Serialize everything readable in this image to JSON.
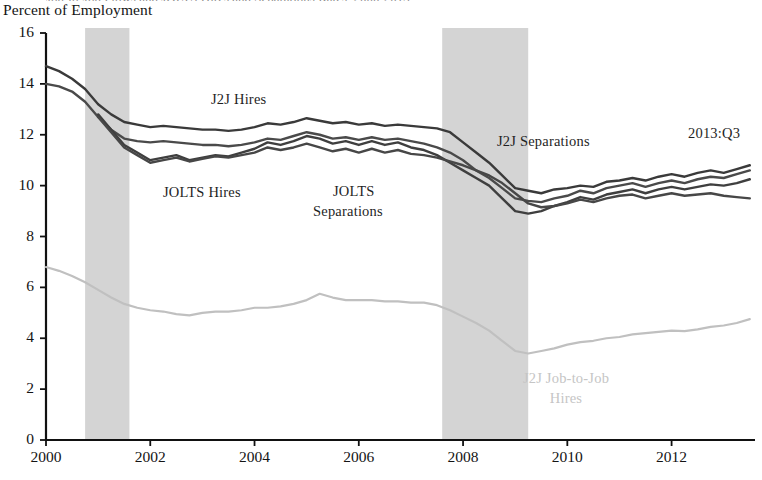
{
  "figure": {
    "cut_off_title_top": "Job-to-Job Flows and JOLTS Hires and Separations Rates, 2000-2013",
    "y_axis_title": "Percent of Employment",
    "date_stamp": "2013:Q3"
  },
  "annotations": [
    {
      "name": "j2j-hires-label",
      "text": "J2J Hires",
      "x": 211,
      "y": 91,
      "color": "#1f1f1f",
      "align": "left"
    },
    {
      "name": "jolts-hires-label",
      "text": "JOLTS Hires",
      "x": 163,
      "y": 184,
      "color": "#1f1f1f",
      "align": "left"
    },
    {
      "name": "jolts-separations-label-line1",
      "text": "JOLTS",
      "x": 333,
      "y": 183,
      "color": "#1f1f1f",
      "align": "left"
    },
    {
      "name": "jolts-separations-label-line2",
      "text": "Separations",
      "x": 313,
      "y": 203,
      "color": "#1f1f1f",
      "align": "left"
    },
    {
      "name": "j2j-separations-label",
      "text": "J2J Separations",
      "x": 497,
      "y": 133,
      "color": "#1f1f1f",
      "align": "left"
    },
    {
      "name": "date-stamp-label",
      "text": "2013:Q3",
      "x": 688,
      "y": 125,
      "color": "#1f1f1f",
      "align": "left"
    },
    {
      "name": "j2j-job-to-job-hires-label-line1",
      "text": "J2J Job-to-Job",
      "x": 566,
      "y": 370,
      "color": "#c5c5c5",
      "align": "center"
    },
    {
      "name": "j2j-job-to-job-hires-label-line2",
      "text": "Hires",
      "x": 566,
      "y": 390,
      "color": "#c5c5c5",
      "align": "center"
    }
  ],
  "chart_data": {
    "type": "line",
    "title": "Job-to-Job Flows and JOLTS Hires and Separations Rates",
    "subtitle": "",
    "xlabel": "",
    "ylabel": "Percent of Employment",
    "xlim": [
      2000.0,
      2013.6
    ],
    "ylim": [
      0,
      16
    ],
    "ytick_values": [
      0,
      2,
      4,
      6,
      8,
      10,
      12,
      14,
      16
    ],
    "ytick_labels": [
      "0",
      "2",
      "4",
      "6",
      "8",
      "10",
      "12",
      "14",
      "16"
    ],
    "xtick_values": [
      2000,
      2002,
      2004,
      2006,
      2008,
      2010,
      2012
    ],
    "xtick_labels": [
      "2000",
      "2002",
      "2004",
      "2006",
      "2008",
      "2010",
      "2012"
    ],
    "grid": false,
    "legend": "inline-annotations",
    "shaded_regions": [
      {
        "name": "recession-2001",
        "x0": 2000.75,
        "x1": 2001.6,
        "color": "#d4d4d4",
        "label": "recession"
      },
      {
        "name": "recession-2008",
        "x0": 2007.6,
        "x1": 2009.25,
        "color": "#d4d4d4",
        "label": "recession"
      }
    ],
    "series": [
      {
        "name": "J2J Hires",
        "color": "#3a3a3a",
        "width": 2.4,
        "x": [
          2000.0,
          2000.25,
          2000.5,
          2000.75,
          2001.0,
          2001.25,
          2001.5,
          2001.75,
          2002.0,
          2002.25,
          2002.5,
          2002.75,
          2003.0,
          2003.25,
          2003.5,
          2003.75,
          2004.0,
          2004.25,
          2004.5,
          2004.75,
          2005.0,
          2005.25,
          2005.5,
          2005.75,
          2006.0,
          2006.25,
          2006.5,
          2006.75,
          2007.0,
          2007.25,
          2007.5,
          2007.75,
          2008.0,
          2008.25,
          2008.5,
          2008.75,
          2009.0,
          2009.25,
          2009.5,
          2009.75,
          2010.0,
          2010.25,
          2010.5,
          2010.75,
          2011.0,
          2011.25,
          2011.5,
          2011.75,
          2012.0,
          2012.25,
          2012.5,
          2012.75,
          2013.0,
          2013.25,
          2013.5
        ],
        "values": [
          14.7,
          14.5,
          14.2,
          13.8,
          13.2,
          12.8,
          12.5,
          12.4,
          12.3,
          12.35,
          12.3,
          12.25,
          12.2,
          12.2,
          12.15,
          12.2,
          12.3,
          12.45,
          12.4,
          12.5,
          12.65,
          12.55,
          12.45,
          12.5,
          12.4,
          12.45,
          12.35,
          12.4,
          12.35,
          12.3,
          12.25,
          12.1,
          11.7,
          11.3,
          10.9,
          10.4,
          9.9,
          9.8,
          9.7,
          9.85,
          9.9,
          10.0,
          9.95,
          10.15,
          10.2,
          10.3,
          10.2,
          10.35,
          10.45,
          10.35,
          10.5,
          10.6,
          10.5,
          10.65,
          10.8
        ]
      },
      {
        "name": "J2J Separations",
        "color": "#4a4a4a",
        "width": 2.4,
        "x": [
          2000.0,
          2000.25,
          2000.5,
          2000.75,
          2001.0,
          2001.25,
          2001.5,
          2001.75,
          2002.0,
          2002.25,
          2002.5,
          2002.75,
          2003.0,
          2003.25,
          2003.5,
          2003.75,
          2004.0,
          2004.25,
          2004.5,
          2004.75,
          2005.0,
          2005.25,
          2005.5,
          2005.75,
          2006.0,
          2006.25,
          2006.5,
          2006.75,
          2007.0,
          2007.25,
          2007.5,
          2007.75,
          2008.0,
          2008.25,
          2008.5,
          2008.75,
          2009.0,
          2009.25,
          2009.5,
          2009.75,
          2010.0,
          2010.25,
          2010.5,
          2010.75,
          2011.0,
          2011.25,
          2011.5,
          2011.75,
          2012.0,
          2012.25,
          2012.5,
          2012.75,
          2013.0,
          2013.25,
          2013.5
        ],
        "values": [
          14.0,
          13.9,
          13.7,
          13.3,
          12.7,
          12.2,
          11.85,
          11.75,
          11.7,
          11.75,
          11.7,
          11.65,
          11.6,
          11.6,
          11.55,
          11.6,
          11.7,
          11.85,
          11.8,
          11.95,
          12.1,
          12.0,
          11.85,
          11.9,
          11.8,
          11.9,
          11.8,
          11.85,
          11.75,
          11.65,
          11.5,
          11.3,
          11.0,
          10.6,
          10.3,
          9.9,
          9.5,
          9.4,
          9.35,
          9.5,
          9.6,
          9.8,
          9.7,
          9.9,
          10.0,
          10.1,
          9.95,
          10.1,
          10.2,
          10.1,
          10.25,
          10.35,
          10.3,
          10.45,
          10.6
        ]
      },
      {
        "name": "JOLTS Hires",
        "color": "#3f3f3f",
        "width": 2.4,
        "x": [
          2001.0,
          2001.25,
          2001.5,
          2001.75,
          2002.0,
          2002.25,
          2002.5,
          2002.75,
          2003.0,
          2003.25,
          2003.5,
          2003.75,
          2004.0,
          2004.25,
          2004.5,
          2004.75,
          2005.0,
          2005.25,
          2005.5,
          2005.75,
          2006.0,
          2006.25,
          2006.5,
          2006.75,
          2007.0,
          2007.25,
          2007.5,
          2007.75,
          2008.0,
          2008.25,
          2008.5,
          2008.75,
          2009.0,
          2009.25,
          2009.5,
          2009.75,
          2010.0,
          2010.25,
          2010.5,
          2010.75,
          2011.0,
          2011.25,
          2011.5,
          2011.75,
          2012.0,
          2012.25,
          2012.5,
          2012.75,
          2013.0,
          2013.25,
          2013.5
        ],
        "values": [
          12.8,
          12.2,
          11.6,
          11.3,
          11.0,
          11.1,
          11.2,
          11.0,
          11.1,
          11.2,
          11.15,
          11.3,
          11.45,
          11.7,
          11.6,
          11.75,
          11.95,
          11.85,
          11.65,
          11.75,
          11.6,
          11.75,
          11.6,
          11.7,
          11.5,
          11.4,
          11.2,
          10.9,
          10.6,
          10.3,
          10.0,
          9.5,
          9.0,
          8.9,
          9.0,
          9.2,
          9.35,
          9.55,
          9.45,
          9.65,
          9.75,
          9.85,
          9.7,
          9.85,
          9.95,
          9.85,
          9.95,
          10.05,
          10.0,
          10.1,
          10.25
        ]
      },
      {
        "name": "JOLTS Separations",
        "color": "#474747",
        "width": 2.4,
        "x": [
          2001.0,
          2001.25,
          2001.5,
          2001.75,
          2002.0,
          2002.25,
          2002.5,
          2002.75,
          2003.0,
          2003.25,
          2003.5,
          2003.75,
          2004.0,
          2004.25,
          2004.5,
          2004.75,
          2005.0,
          2005.25,
          2005.5,
          2005.75,
          2006.0,
          2006.25,
          2006.5,
          2006.75,
          2007.0,
          2007.25,
          2007.5,
          2007.75,
          2008.0,
          2008.25,
          2008.5,
          2008.75,
          2009.0,
          2009.25,
          2009.5,
          2009.75,
          2010.0,
          2010.25,
          2010.5,
          2010.75,
          2011.0,
          2011.25,
          2011.5,
          2011.75,
          2012.0,
          2012.25,
          2012.5,
          2012.75,
          2013.0,
          2013.25,
          2013.5
        ],
        "values": [
          12.7,
          12.1,
          11.5,
          11.2,
          10.9,
          11.0,
          11.1,
          10.95,
          11.05,
          11.15,
          11.1,
          11.2,
          11.3,
          11.5,
          11.4,
          11.5,
          11.65,
          11.5,
          11.35,
          11.45,
          11.3,
          11.45,
          11.3,
          11.4,
          11.25,
          11.2,
          11.1,
          10.95,
          10.8,
          10.6,
          10.4,
          10.1,
          9.7,
          9.3,
          9.15,
          9.2,
          9.3,
          9.45,
          9.35,
          9.5,
          9.6,
          9.65,
          9.5,
          9.6,
          9.7,
          9.6,
          9.65,
          9.7,
          9.6,
          9.55,
          9.5
        ]
      },
      {
        "name": "J2J Job-to-Job Hires",
        "color": "#c0c0c0",
        "width": 2.2,
        "x": [
          2000.0,
          2000.25,
          2000.5,
          2000.75,
          2001.0,
          2001.25,
          2001.5,
          2001.75,
          2002.0,
          2002.25,
          2002.5,
          2002.75,
          2003.0,
          2003.25,
          2003.5,
          2003.75,
          2004.0,
          2004.25,
          2004.5,
          2004.75,
          2005.0,
          2005.25,
          2005.5,
          2005.75,
          2006.0,
          2006.25,
          2006.5,
          2006.75,
          2007.0,
          2007.25,
          2007.5,
          2007.75,
          2008.0,
          2008.25,
          2008.5,
          2008.75,
          2009.0,
          2009.25,
          2009.5,
          2009.75,
          2010.0,
          2010.25,
          2010.5,
          2010.75,
          2011.0,
          2011.25,
          2011.5,
          2011.75,
          2012.0,
          2012.25,
          2012.5,
          2012.75,
          2013.0,
          2013.25,
          2013.5
        ],
        "values": [
          6.8,
          6.65,
          6.45,
          6.2,
          5.9,
          5.6,
          5.35,
          5.2,
          5.1,
          5.05,
          4.95,
          4.9,
          5.0,
          5.05,
          5.05,
          5.1,
          5.2,
          5.2,
          5.25,
          5.35,
          5.5,
          5.75,
          5.6,
          5.5,
          5.5,
          5.5,
          5.45,
          5.45,
          5.4,
          5.4,
          5.3,
          5.1,
          4.85,
          4.6,
          4.3,
          3.9,
          3.5,
          3.4,
          3.5,
          3.6,
          3.75,
          3.85,
          3.9,
          4.0,
          4.05,
          4.15,
          4.2,
          4.25,
          4.3,
          4.28,
          4.35,
          4.45,
          4.5,
          4.6,
          4.75
        ]
      }
    ]
  },
  "axes": {
    "x_axis_name": "year-axis",
    "y_axis_name": "percent-axis"
  }
}
